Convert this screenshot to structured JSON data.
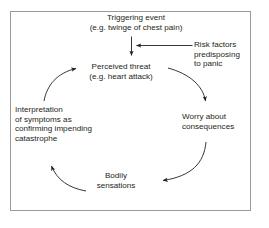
{
  "diagram": {
    "type": "cycle-flow-diagram",
    "frame": {
      "border_color": "#9a9a9a",
      "background": "#ffffff"
    },
    "text_color": "#231f20",
    "arrow_color": "#231f20",
    "nodes": [
      {
        "id": "triggering-event",
        "label": "Triggering event\n(e.g. twinge of chest pain)",
        "align": "center"
      },
      {
        "id": "perceived-threat",
        "label": "Perceived threat\n(e.g. heart attack)",
        "align": "center"
      },
      {
        "id": "risk-factors",
        "label": "Risk factors\npredisposing\nto panic",
        "align": "left"
      },
      {
        "id": "worry-about-consequences",
        "label": "Worry about\nconsequences",
        "align": "left"
      },
      {
        "id": "bodily-sensations",
        "label": "Bodily\nsensations",
        "align": "center"
      },
      {
        "id": "interpretation-of-symptoms",
        "label": "Interpretation\nof symptoms as\nconfirming impending\ncatastrophe",
        "align": "left"
      }
    ],
    "arrows": [
      {
        "id": "trigger-to-threat",
        "from": "triggering-event",
        "to": "perceived-threat",
        "style": "straight-down"
      },
      {
        "id": "risk-to-threat",
        "from": "risk-factors",
        "to": "perceived-threat",
        "style": "straight-left"
      },
      {
        "id": "threat-to-worry",
        "from": "perceived-threat",
        "to": "worry-about-consequences",
        "style": "curve-clockwise"
      },
      {
        "id": "worry-to-bodily",
        "from": "worry-about-consequences",
        "to": "bodily-sensations",
        "style": "curve-clockwise"
      },
      {
        "id": "bodily-to-interpretation",
        "from": "bodily-sensations",
        "to": "interpretation-of-symptoms",
        "style": "curve-clockwise"
      },
      {
        "id": "interpretation-to-threat",
        "from": "interpretation-of-symptoms",
        "to": "perceived-threat",
        "style": "curve-clockwise"
      }
    ]
  }
}
